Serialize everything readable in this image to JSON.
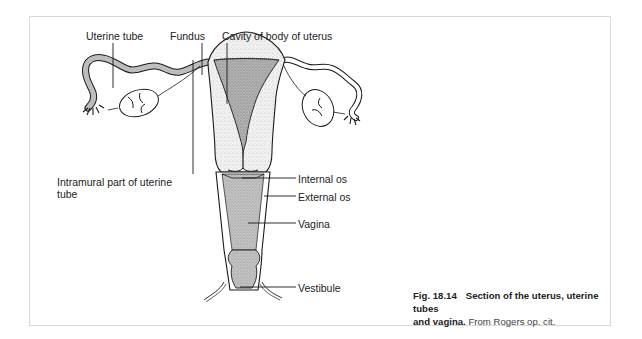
{
  "figure": {
    "number": "Fig. 18.14",
    "title_part1": "Section of the uterus, uterine tubes",
    "title_part2": "and vagina.",
    "source": "From Rogers op. cit."
  },
  "labels": {
    "uterine_tube": "Uterine tube",
    "fundus": "Fundus",
    "cavity": "Cavity of body of uterus",
    "intramural_line1": "Intramural part of uterine",
    "intramural_line2": "tube",
    "internal_os": "Internal os",
    "external_os": "External os",
    "vagina": "Vagina",
    "vestibule": "Vestibule"
  },
  "colors": {
    "frame_border": "#d9d9d9",
    "line": "#1a1a1a",
    "stipple_light": "#e6e6e6",
    "stipple_dark": "#a8a8a8",
    "vagina_fill": "#bdbdbd"
  }
}
